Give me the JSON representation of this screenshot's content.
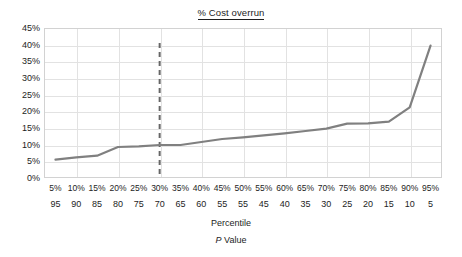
{
  "chart_data": {
    "type": "line",
    "title": "% Cost overrun",
    "title_underlined": true,
    "xlabel": "Percentile",
    "xlabel_secondary": "P Value",
    "ylabel": "",
    "grid": true,
    "legend": false,
    "legend_position": "none",
    "ylim": [
      0,
      45
    ],
    "y_ticks": [
      0,
      5,
      10,
      15,
      20,
      25,
      30,
      35,
      40,
      45
    ],
    "y_ticklabels": [
      "0%",
      "5%",
      "10%",
      "15%",
      "20%",
      "25%",
      "30%",
      "35%",
      "40%",
      "45%"
    ],
    "categories": [
      "5%",
      "10%",
      "15%",
      "20%",
      "25%",
      "30%",
      "35%",
      "40%",
      "45%",
      "50%",
      "55%",
      "60%",
      "65%",
      "70%",
      "75%",
      "80%",
      "85%",
      "90%",
      "95%"
    ],
    "x_ticklabels_secondary": [
      "95",
      "90",
      "85",
      "80",
      "75",
      "70",
      "65",
      "60",
      "55",
      "55",
      "45",
      "40",
      "35",
      "30",
      "25",
      "20",
      "15",
      "10",
      "5"
    ],
    "values": [
      5.5,
      6.2,
      6.7,
      9.3,
      9.5,
      9.9,
      9.9,
      10.8,
      11.7,
      12.2,
      12.8,
      13.4,
      14.1,
      14.8,
      16.3,
      16.4,
      16.9,
      21.2,
      39.7
    ],
    "series": [
      {
        "name": "% Cost overrun",
        "color": "#808080",
        "values": [
          5.5,
          6.2,
          6.7,
          9.3,
          9.5,
          9.9,
          9.9,
          10.8,
          11.7,
          12.2,
          12.8,
          13.4,
          14.1,
          14.8,
          16.3,
          16.4,
          16.9,
          21.2,
          39.7
        ]
      }
    ],
    "annotations": [
      {
        "name": "reference-line",
        "type": "vline",
        "x_category": "30%",
        "x_index": 5,
        "style": "dashed",
        "color": "#666666",
        "y_from": 0,
        "y_to": 40.5
      }
    ],
    "colors": {
      "series_line": "#808080",
      "reference_line": "#666666",
      "grid": "#e2e2e2",
      "plot_border": "#d2d2d2",
      "text": "#1d1d1d",
      "background": "#ffffff"
    }
  }
}
